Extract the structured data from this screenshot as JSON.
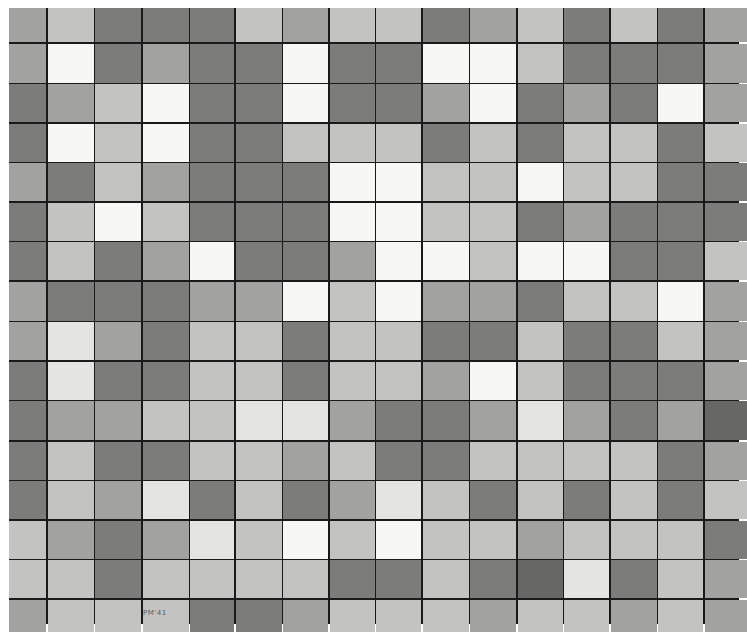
{
  "artwork": {
    "description": "Grayscale checkerboard grid painting, 16 columns by 16 rows",
    "signature": "PM'41",
    "columns": 16,
    "rows": 16,
    "tones": {
      "W": "#f7f7f5",
      "W2": "#e4e4e2",
      "L": "#c3c3c1",
      "M": "#a2a2a0",
      "D": "#7c7c7a",
      "D2": "#676765",
      "line": "#1a1a1a"
    },
    "grid": [
      [
        "M",
        "L",
        "D",
        "D",
        "D",
        "L",
        "M",
        "L",
        "L",
        "D",
        "M",
        "L",
        "D",
        "L",
        "D",
        "M"
      ],
      [
        "M",
        "W",
        "D",
        "M",
        "D",
        "D",
        "W",
        "D",
        "D",
        "W",
        "W",
        "L",
        "D",
        "D",
        "D",
        "M"
      ],
      [
        "D",
        "M",
        "L",
        "W",
        "D",
        "D",
        "W",
        "D",
        "D",
        "M",
        "W",
        "D",
        "M",
        "D",
        "W",
        "M"
      ],
      [
        "D",
        "W",
        "L",
        "W",
        "D",
        "D",
        "L",
        "L",
        "L",
        "D",
        "L",
        "D",
        "L",
        "L",
        "D",
        "L"
      ],
      [
        "M",
        "D",
        "L",
        "M",
        "D",
        "D",
        "D",
        "W",
        "W",
        "L",
        "L",
        "W",
        "L",
        "L",
        "D",
        "D"
      ],
      [
        "D",
        "L",
        "W",
        "L",
        "D",
        "D",
        "D",
        "W",
        "W",
        "L",
        "L",
        "D",
        "M",
        "D",
        "D",
        "D"
      ],
      [
        "D",
        "L",
        "D",
        "M",
        "W",
        "D",
        "D",
        "M",
        "W",
        "W",
        "L",
        "W",
        "W",
        "D",
        "D",
        "L"
      ],
      [
        "M",
        "D",
        "D",
        "D",
        "M",
        "M",
        "W",
        "L",
        "W",
        "M",
        "M",
        "D",
        "L",
        "L",
        "W",
        "M"
      ],
      [
        "M",
        "W2",
        "M",
        "D",
        "L",
        "L",
        "D",
        "L",
        "L",
        "D",
        "D",
        "L",
        "D",
        "D",
        "L",
        "M"
      ],
      [
        "D",
        "W2",
        "D",
        "D",
        "L",
        "L",
        "D",
        "L",
        "L",
        "M",
        "W",
        "L",
        "D",
        "D",
        "D",
        "M"
      ],
      [
        "D",
        "M",
        "M",
        "L",
        "L",
        "W2",
        "W2",
        "M",
        "D",
        "D",
        "M",
        "W2",
        "M",
        "D",
        "M",
        "D2"
      ],
      [
        "D",
        "L",
        "D",
        "D",
        "L",
        "L",
        "M",
        "L",
        "D",
        "D",
        "L",
        "L",
        "L",
        "L",
        "D",
        "M"
      ],
      [
        "D",
        "L",
        "M",
        "W2",
        "D",
        "L",
        "D",
        "M",
        "W2",
        "L",
        "D",
        "L",
        "D",
        "L",
        "D",
        "L"
      ],
      [
        "L",
        "M",
        "D",
        "M",
        "W2",
        "L",
        "W",
        "L",
        "W",
        "L",
        "L",
        "M",
        "L",
        "L",
        "L",
        "D"
      ],
      [
        "L",
        "L",
        "D",
        "L",
        "L",
        "L",
        "L",
        "D",
        "D",
        "L",
        "D",
        "D2",
        "W2",
        "D",
        "L",
        "M"
      ],
      [
        "M",
        "L",
        "L",
        "L",
        "D",
        "D",
        "M",
        "L",
        "L",
        "L",
        "M",
        "L",
        "L",
        "M",
        "L",
        "M"
      ]
    ]
  }
}
